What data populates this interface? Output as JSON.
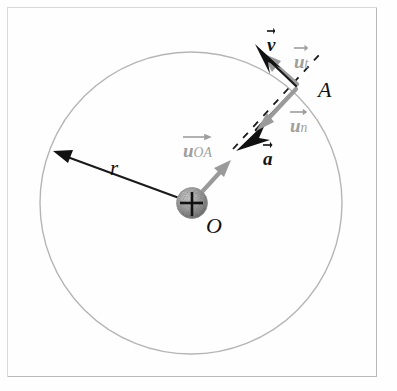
{
  "figure": {
    "background": "#fefefe",
    "frame_color": "#b9b9b9"
  },
  "colors": {
    "circle": "#b5b5b5",
    "black": "#1a1a1a",
    "gray_vector": "#9a9a9a",
    "gray_label": "#9e9e9e",
    "sphere_light": "#cfcfcf",
    "sphere_dark": "#8a8a8a"
  },
  "geometry": {
    "center": {
      "x": 191,
      "y": 203,
      "label": "O"
    },
    "circle_radius": 151,
    "point_A": {
      "x": 299,
      "y": 85,
      "label": "A"
    },
    "sphere_radius": 15,
    "radius_arrow_tip": {
      "x": 55,
      "y": 152
    }
  },
  "labels": {
    "radius": "r",
    "origin": "O",
    "point": "A",
    "velocity": "v",
    "unit_tangential_base": "u",
    "unit_tangential_sub": "t",
    "unit_normal_base": "u",
    "unit_normal_sub": "n",
    "unit_radial_base": "u",
    "unit_radial_sub": "OA",
    "acceleration": "a"
  },
  "vectors": [
    {
      "name": "v",
      "label": "v",
      "color": "black",
      "style": "solid",
      "description": "velocity, tangent to circle at A, pointing up-left"
    },
    {
      "name": "u_t",
      "label": "u_t",
      "color": "gray",
      "style": "solid",
      "description": "unit tangential vector at A, pointing up-left"
    },
    {
      "name": "u_n",
      "label": "u_n",
      "color": "gray",
      "style": "solid",
      "description": "unit normal vector at A, pointing toward center"
    },
    {
      "name": "a",
      "label": "a",
      "color": "black",
      "style": "solid",
      "description": "acceleration, directed toward center"
    },
    {
      "name": "u_OA",
      "label": "u_OA",
      "color": "gray",
      "style": "solid",
      "description": "unit radial vector from O toward A"
    },
    {
      "name": "r",
      "label": "r",
      "color": "black",
      "style": "solid",
      "description": "radius arrow from center to circle, upper-left"
    }
  ]
}
